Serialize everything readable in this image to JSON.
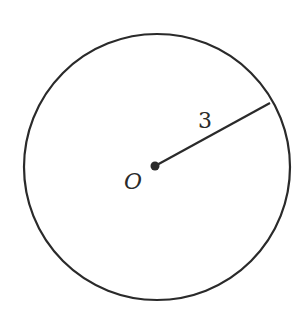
{
  "diagram": {
    "type": "circle",
    "center": {
      "label": "O",
      "x": 155,
      "y": 166
    },
    "radius_px": 133,
    "radius_label": "3",
    "radius_end": {
      "x": 270,
      "y": 103
    },
    "stroke_color": "#2a2a2a",
    "background": "#ffffff"
  }
}
